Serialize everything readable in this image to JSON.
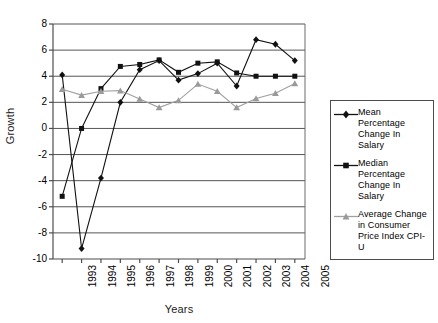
{
  "chart_data": {
    "type": "line",
    "title": "",
    "xlabel": "Years",
    "ylabel": "Growth",
    "categories": [
      "1993",
      "1994",
      "1995",
      "1996",
      "1997",
      "1998",
      "1999",
      "2000",
      "2001",
      "2002",
      "2003",
      "2004",
      "2005"
    ],
    "ylim": [
      -10,
      8
    ],
    "yticks": [
      8,
      6,
      4,
      2,
      0,
      -2,
      -4,
      -6,
      -8,
      -10
    ],
    "grid": "horizontal",
    "legend_position": "right",
    "series": [
      {
        "name": "Mean Percentage Change In Salary",
        "marker": "diamond",
        "color": "#111111",
        "values": [
          4.1,
          -9.2,
          -3.8,
          2.0,
          4.5,
          5.2,
          3.7,
          4.2,
          5.0,
          3.25,
          6.8,
          6.45,
          5.2
        ]
      },
      {
        "name": "Median Percentage Change In Salary",
        "marker": "square",
        "color": "#111111",
        "values": [
          -5.2,
          0.0,
          3.05,
          4.75,
          4.9,
          5.25,
          4.3,
          5.0,
          5.1,
          4.25,
          4.0,
          4.0,
          4.0
        ]
      },
      {
        "name": "Average Change in Consumer Price Index CPI-U",
        "marker": "triangle",
        "color": "#a0a0a0",
        "values": [
          3.0,
          2.55,
          2.85,
          2.9,
          2.25,
          1.6,
          2.15,
          3.4,
          2.85,
          1.6,
          2.3,
          2.7,
          3.45
        ]
      }
    ]
  },
  "axes": {
    "ylabel": "Growth",
    "xlabel": "Years",
    "ytick_labels": [
      "8",
      "6",
      "4",
      "2",
      "0",
      "-2",
      "-4",
      "-6",
      "-8",
      "-10"
    ],
    "xtick_labels": [
      "1993",
      "1994",
      "1995",
      "1996",
      "1997",
      "1998",
      "1999",
      "2000",
      "2001",
      "2002",
      "2003",
      "2004",
      "2005"
    ]
  },
  "legend": {
    "entries": [
      {
        "label": "Mean Percentage Change In Salary",
        "marker": "diamond-marker-icon"
      },
      {
        "label": "Median Percentage Change In Salary",
        "marker": "square-marker-icon"
      },
      {
        "label": "Average Change in Consumer Price Index CPI-U",
        "marker": "triangle-marker-icon"
      }
    ]
  },
  "colors": {
    "axis": "#4d4d4d",
    "gridline": "#555555",
    "series_dark": "#111111",
    "series_gray": "#a0a0a0",
    "background": "#ffffff"
  }
}
